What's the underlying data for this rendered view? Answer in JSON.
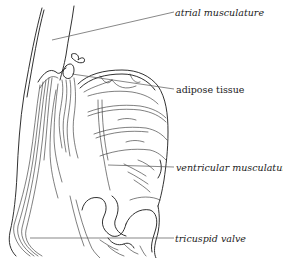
{
  "diagram": {
    "labels": [
      {
        "id": "atrial",
        "text": "atrial musculature",
        "style": "italic"
      },
      {
        "id": "adipose",
        "text": "adipose tissue",
        "style": "upright"
      },
      {
        "id": "ventricular",
        "text": "ventricular musculature",
        "style": "italic"
      },
      {
        "id": "tricuspid",
        "text": "tricuspid valve",
        "style": "italic"
      }
    ],
    "colors": {
      "ink": "#1a1a1a",
      "leader": "#555555",
      "background": "#ffffff"
    }
  }
}
